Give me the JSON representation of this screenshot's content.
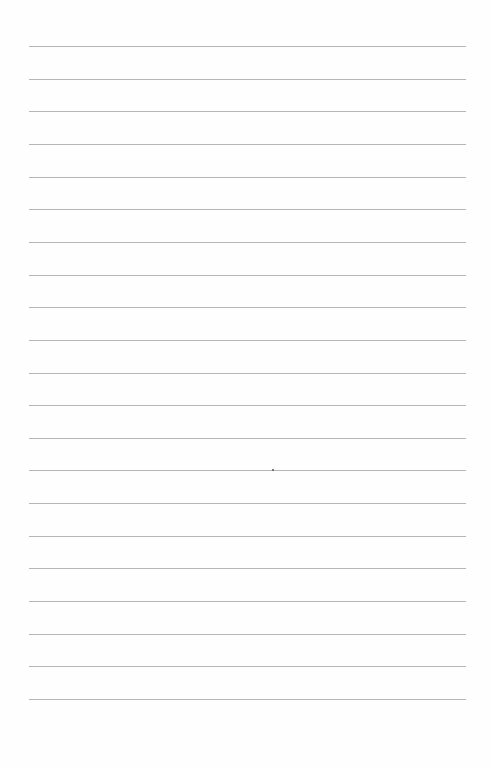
{
  "page": {
    "type": "lined-paper",
    "background_color": "#fefefe",
    "rule_color": "#a9a9a9",
    "rule_count": 21,
    "first_rule_y": 46,
    "rule_spacing": 32.65,
    "rule_left": 29,
    "rule_width": 437
  },
  "text": []
}
